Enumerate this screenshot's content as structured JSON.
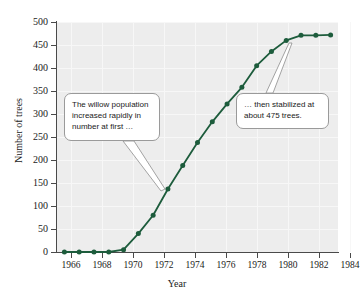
{
  "chart_data": {
    "type": "line",
    "title": "",
    "xlabel": "Year",
    "ylabel": "Number of trees",
    "xlim": [
      1965.5,
      1984.5
    ],
    "ylim": [
      0,
      500
    ],
    "grid": true,
    "legend": "none",
    "x_ticks": [
      "1966",
      "1968",
      "1970",
      "1972",
      "1974",
      "1976",
      "1978",
      "1980",
      "1982",
      "1984"
    ],
    "y_ticks": [
      "0",
      "50",
      "100",
      "150",
      "200",
      "250",
      "300",
      "350",
      "400",
      "450",
      "500"
    ],
    "x": [
      1966,
      1967,
      1968,
      1969,
      1970,
      1971,
      1972,
      1973,
      1974,
      1975,
      1976,
      1977,
      1978,
      1979,
      1980,
      1981,
      1982,
      1983,
      1984
    ],
    "values": [
      0,
      0,
      0,
      0,
      5,
      40,
      80,
      137,
      188,
      238,
      283,
      322,
      358,
      405,
      436,
      460,
      471,
      471,
      472
    ],
    "series": [
      {
        "name": "Willow trees",
        "color": "#1d5c3c",
        "marker": "circle",
        "values": [
          0,
          0,
          0,
          0,
          5,
          40,
          80,
          137,
          188,
          238,
          283,
          322,
          358,
          405,
          436,
          460,
          471,
          471,
          472
        ]
      }
    ],
    "annotations": [
      {
        "id": "annotation-growth",
        "lines": [
          "The willow population",
          "increased rapidly in",
          "number at first …"
        ],
        "points_to_year": 1973
      },
      {
        "id": "annotation-plateau",
        "lines": [
          "… then stabilized at",
          "about 475 trees."
        ],
        "points_to_year": 1982
      }
    ]
  },
  "colors": {
    "series": "#1d5c3c",
    "plot_background": "#ededed",
    "gridline": "#f7f7f7",
    "axis": "#4a4a4a",
    "callout_border": "#9a9a9a",
    "text": "#1a1a1a"
  }
}
